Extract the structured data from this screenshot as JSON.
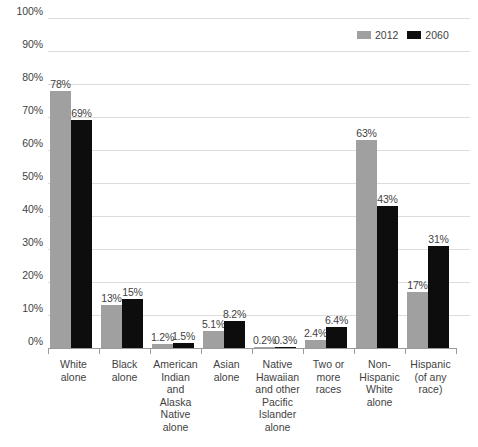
{
  "chart_data": {
    "type": "bar",
    "title": "",
    "xlabel": "",
    "ylabel": "",
    "ylim": [
      0,
      100
    ],
    "y_unit": "%",
    "grid": true,
    "legend_position": "top-right",
    "yticks": [
      "0%",
      "10%",
      "20%",
      "30%",
      "40%",
      "50%",
      "60%",
      "70%",
      "80%",
      "90%",
      "100%"
    ],
    "ytick_values": [
      0,
      10,
      20,
      30,
      40,
      50,
      60,
      70,
      80,
      90,
      100
    ],
    "categories": [
      "White\nalone",
      "Black\nalone",
      "American\nIndian\nand Alaska\nNative\nalone",
      "Asian\nalone",
      "Native\nHawaiian\nand other\nPacific\nIslander\nalone",
      "Two or\nmore\nraces",
      "Non-\nHispanic\nWhite\nalone",
      "Hispanic\n(of any\nrace)"
    ],
    "series": [
      {
        "name": "2012",
        "color": "#a0a0a0",
        "values": [
          78,
          13,
          1.2,
          5.1,
          0.2,
          2.4,
          63,
          17
        ],
        "labels": [
          "78%",
          "13%",
          "1.2%",
          "5.1%",
          "0.2%",
          "2.4%",
          "63%",
          "17%"
        ]
      },
      {
        "name": "2060",
        "color": "#0d0d0d",
        "values": [
          69,
          15,
          1.5,
          8.2,
          0.3,
          6.4,
          43,
          31
        ],
        "labels": [
          "69%",
          "15%",
          "1.5%",
          "0.3%",
          "6.4%",
          "43%",
          "31%"
        ]
      }
    ]
  },
  "legend": {
    "items": [
      {
        "label": "2012",
        "color": "#a0a0a0"
      },
      {
        "label": "2060",
        "color": "#0d0d0d"
      }
    ]
  }
}
